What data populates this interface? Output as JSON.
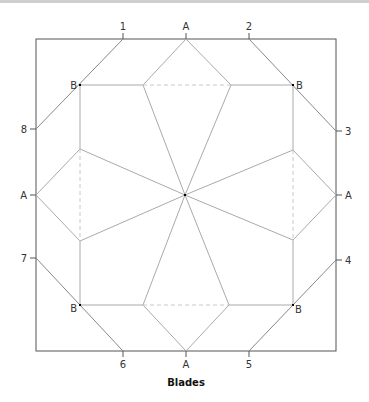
{
  "diagram": {
    "caption": "Blades",
    "colors": {
      "frame": "#555555",
      "fold": "#aaaaaa",
      "dashed": "#c8c8c8",
      "point": "#000000",
      "label": "#333333",
      "topbar": "#cfcfcf"
    },
    "edge_labels": {
      "top": [
        "1",
        "A",
        "2"
      ],
      "bottom": [
        "6",
        "A",
        "5"
      ],
      "left": [
        "8",
        "A",
        "7"
      ],
      "right": [
        "3",
        "A",
        "4"
      ]
    },
    "corner_points": {
      "top_left": "B",
      "top_right": "B",
      "bottom_left": "B",
      "bottom_right": "B"
    }
  }
}
